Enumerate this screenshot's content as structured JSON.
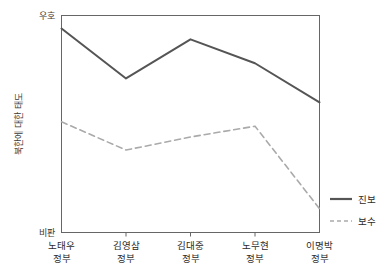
{
  "chart_data": {
    "type": "line",
    "title": "",
    "xlabel": "",
    "ylabel": "북한에 대한 태도",
    "categories": [
      "노태우\n정부",
      "김영삼\n정부",
      "김대중\n정부",
      "노무현\n정부",
      "이명박\n정부"
    ],
    "category_lines": [
      [
        "노태우",
        "정부"
      ],
      [
        "김영삼",
        "정부"
      ],
      [
        "김대중",
        "정부"
      ],
      [
        "노무현",
        "정부"
      ],
      [
        "이명박",
        "정부"
      ]
    ],
    "ylim": [
      0,
      100
    ],
    "y_axis_top_label": "우호",
    "y_axis_bottom_label": "비판",
    "grid": false,
    "legend_position": "right",
    "series": [
      {
        "name": "진보",
        "style": "solid",
        "color": "#555555",
        "values": [
          94,
          71,
          89,
          78,
          60
        ]
      },
      {
        "name": "보수",
        "style": "dashed",
        "color": "#aaaaaa",
        "values": [
          51,
          38,
          44,
          49,
          11
        ]
      }
    ]
  },
  "legend": {
    "items": [
      {
        "label": "진보"
      },
      {
        "label": "보수"
      }
    ]
  },
  "colors": {
    "progressive_line": "#555555",
    "conservative_line": "#aaaaaa",
    "axis": "#666666",
    "text": "#2b2b2b"
  }
}
